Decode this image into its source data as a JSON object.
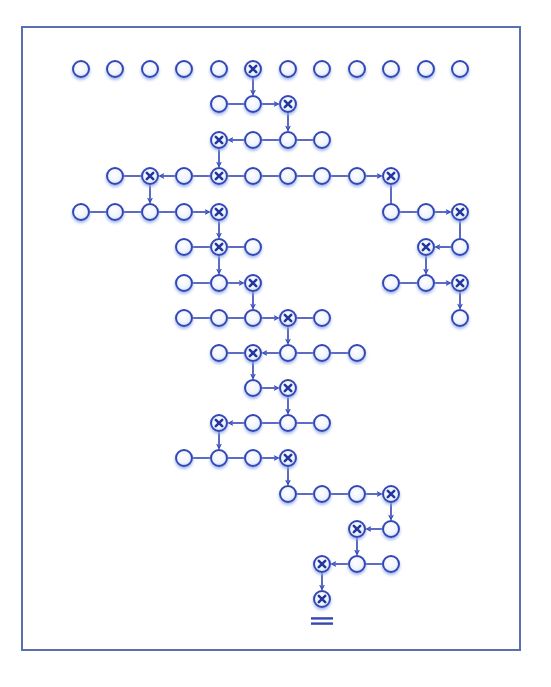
{
  "diagram": {
    "colors": {
      "frame": "#5a6fae",
      "stroke": "#3347b5",
      "fill_center": "#ffffff",
      "fill_edge": "#c8d6f5",
      "glow": "#9fb6ef",
      "x_mark": "#23389c"
    },
    "grid": {
      "col_x": [
        81,
        115,
        150,
        184,
        219,
        253,
        288,
        322,
        357,
        391,
        426,
        460
      ],
      "row_y": [
        69,
        104,
        140,
        176,
        212,
        247,
        283,
        318,
        353,
        388,
        423,
        458,
        494,
        529,
        564,
        599
      ],
      "radius": 8
    },
    "nodes": [
      {
        "r": 0,
        "c": 0
      },
      {
        "r": 0,
        "c": 1
      },
      {
        "r": 0,
        "c": 2
      },
      {
        "r": 0,
        "c": 3
      },
      {
        "r": 0,
        "c": 4
      },
      {
        "r": 0,
        "c": 5,
        "x": true
      },
      {
        "r": 0,
        "c": 6
      },
      {
        "r": 0,
        "c": 7
      },
      {
        "r": 0,
        "c": 8
      },
      {
        "r": 0,
        "c": 9
      },
      {
        "r": 0,
        "c": 10
      },
      {
        "r": 0,
        "c": 11
      },
      {
        "r": 1,
        "c": 4
      },
      {
        "r": 1,
        "c": 5
      },
      {
        "r": 1,
        "c": 6,
        "x": true
      },
      {
        "r": 2,
        "c": 4,
        "x": true
      },
      {
        "r": 2,
        "c": 5
      },
      {
        "r": 2,
        "c": 6
      },
      {
        "r": 2,
        "c": 7
      },
      {
        "r": 3,
        "c": 1
      },
      {
        "r": 3,
        "c": 2,
        "x": true
      },
      {
        "r": 3,
        "c": 3
      },
      {
        "r": 3,
        "c": 4,
        "x": true
      },
      {
        "r": 3,
        "c": 5
      },
      {
        "r": 3,
        "c": 6
      },
      {
        "r": 3,
        "c": 7
      },
      {
        "r": 3,
        "c": 8
      },
      {
        "r": 3,
        "c": 9,
        "x": true
      },
      {
        "r": 4,
        "c": 0
      },
      {
        "r": 4,
        "c": 1
      },
      {
        "r": 4,
        "c": 2
      },
      {
        "r": 4,
        "c": 3
      },
      {
        "r": 4,
        "c": 4,
        "x": true
      },
      {
        "r": 4,
        "c": 9
      },
      {
        "r": 4,
        "c": 10
      },
      {
        "r": 4,
        "c": 11,
        "x": true
      },
      {
        "r": 5,
        "c": 3
      },
      {
        "r": 5,
        "c": 4,
        "x": true
      },
      {
        "r": 5,
        "c": 5
      },
      {
        "r": 5,
        "c": 10,
        "x": true
      },
      {
        "r": 5,
        "c": 11
      },
      {
        "r": 6,
        "c": 3
      },
      {
        "r": 6,
        "c": 4
      },
      {
        "r": 6,
        "c": 5,
        "x": true
      },
      {
        "r": 6,
        "c": 9
      },
      {
        "r": 6,
        "c": 10
      },
      {
        "r": 6,
        "c": 11,
        "x": true
      },
      {
        "r": 7,
        "c": 3
      },
      {
        "r": 7,
        "c": 4
      },
      {
        "r": 7,
        "c": 5
      },
      {
        "r": 7,
        "c": 6,
        "x": true
      },
      {
        "r": 7,
        "c": 7
      },
      {
        "r": 7,
        "c": 11
      },
      {
        "r": 8,
        "c": 4
      },
      {
        "r": 8,
        "c": 5,
        "x": true
      },
      {
        "r": 8,
        "c": 6
      },
      {
        "r": 8,
        "c": 7
      },
      {
        "r": 8,
        "c": 8
      },
      {
        "r": 9,
        "c": 5
      },
      {
        "r": 9,
        "c": 6,
        "x": true
      },
      {
        "r": 10,
        "c": 4,
        "x": true
      },
      {
        "r": 10,
        "c": 5
      },
      {
        "r": 10,
        "c": 6
      },
      {
        "r": 10,
        "c": 7
      },
      {
        "r": 11,
        "c": 3
      },
      {
        "r": 11,
        "c": 4
      },
      {
        "r": 11,
        "c": 5
      },
      {
        "r": 11,
        "c": 6,
        "x": true
      },
      {
        "r": 12,
        "c": 6
      },
      {
        "r": 12,
        "c": 7
      },
      {
        "r": 12,
        "c": 8
      },
      {
        "r": 12,
        "c": 9,
        "x": true
      },
      {
        "r": 13,
        "c": 8,
        "x": true
      },
      {
        "r": 13,
        "c": 9
      },
      {
        "r": 14,
        "c": 7,
        "x": true
      },
      {
        "r": 14,
        "c": 8
      },
      {
        "r": 14,
        "c": 9
      },
      {
        "r": 15,
        "c": 7,
        "x": true
      }
    ],
    "edges": [
      {
        "from": [
          0,
          5
        ],
        "to": [
          1,
          5
        ],
        "arrow": true
      },
      {
        "from": [
          1,
          4
        ],
        "to": [
          1,
          5
        ],
        "arrow": false
      },
      {
        "from": [
          1,
          5
        ],
        "to": [
          1,
          6
        ],
        "arrow": true
      },
      {
        "from": [
          1,
          6
        ],
        "to": [
          2,
          6
        ],
        "arrow": true
      },
      {
        "from": [
          2,
          5
        ],
        "to": [
          2,
          4
        ],
        "arrow": true
      },
      {
        "from": [
          2,
          5
        ],
        "to": [
          2,
          6
        ],
        "arrow": false
      },
      {
        "from": [
          2,
          6
        ],
        "to": [
          2,
          7
        ],
        "arrow": false
      },
      {
        "from": [
          2,
          4
        ],
        "to": [
          3,
          4
        ],
        "arrow": true
      },
      {
        "from": [
          3,
          1
        ],
        "to": [
          3,
          2
        ],
        "arrow": false
      },
      {
        "from": [
          3,
          3
        ],
        "to": [
          3,
          2
        ],
        "arrow": true
      },
      {
        "from": [
          3,
          3
        ],
        "to": [
          3,
          4
        ],
        "arrow": false
      },
      {
        "from": [
          3,
          4
        ],
        "to": [
          3,
          5
        ],
        "arrow": false
      },
      {
        "from": [
          3,
          5
        ],
        "to": [
          3,
          6
        ],
        "arrow": false
      },
      {
        "from": [
          3,
          6
        ],
        "to": [
          3,
          7
        ],
        "arrow": false
      },
      {
        "from": [
          3,
          7
        ],
        "to": [
          3,
          8
        ],
        "arrow": false
      },
      {
        "from": [
          3,
          8
        ],
        "to": [
          3,
          9
        ],
        "arrow": true
      },
      {
        "from": [
          3,
          2
        ],
        "to": [
          4,
          2
        ],
        "arrow": true
      },
      {
        "from": [
          3,
          9
        ],
        "to": [
          4,
          9
        ],
        "arrow": false
      },
      {
        "from": [
          4,
          0
        ],
        "to": [
          4,
          1
        ],
        "arrow": false
      },
      {
        "from": [
          4,
          1
        ],
        "to": [
          4,
          2
        ],
        "arrow": false
      },
      {
        "from": [
          4,
          2
        ],
        "to": [
          4,
          3
        ],
        "arrow": false
      },
      {
        "from": [
          4,
          3
        ],
        "to": [
          4,
          4
        ],
        "arrow": true
      },
      {
        "from": [
          4,
          9
        ],
        "to": [
          4,
          10
        ],
        "arrow": false
      },
      {
        "from": [
          4,
          10
        ],
        "to": [
          4,
          11
        ],
        "arrow": true
      },
      {
        "from": [
          4,
          4
        ],
        "to": [
          5,
          4
        ],
        "arrow": true
      },
      {
        "from": [
          4,
          11
        ],
        "to": [
          5,
          11
        ],
        "arrow": false
      },
      {
        "from": [
          5,
          3
        ],
        "to": [
          5,
          4
        ],
        "arrow": false
      },
      {
        "from": [
          5,
          4
        ],
        "to": [
          5,
          5
        ],
        "arrow": false
      },
      {
        "from": [
          5,
          11
        ],
        "to": [
          5,
          10
        ],
        "arrow": true
      },
      {
        "from": [
          5,
          4
        ],
        "to": [
          6,
          4
        ],
        "arrow": true
      },
      {
        "from": [
          5,
          10
        ],
        "to": [
          6,
          10
        ],
        "arrow": true
      },
      {
        "from": [
          6,
          3
        ],
        "to": [
          6,
          4
        ],
        "arrow": false
      },
      {
        "from": [
          6,
          4
        ],
        "to": [
          6,
          5
        ],
        "arrow": true
      },
      {
        "from": [
          6,
          9
        ],
        "to": [
          6,
          10
        ],
        "arrow": false
      },
      {
        "from": [
          6,
          10
        ],
        "to": [
          6,
          11
        ],
        "arrow": true
      },
      {
        "from": [
          6,
          5
        ],
        "to": [
          7,
          5
        ],
        "arrow": true
      },
      {
        "from": [
          6,
          11
        ],
        "to": [
          7,
          11
        ],
        "arrow": true
      },
      {
        "from": [
          7,
          3
        ],
        "to": [
          7,
          4
        ],
        "arrow": false
      },
      {
        "from": [
          7,
          4
        ],
        "to": [
          7,
          5
        ],
        "arrow": false
      },
      {
        "from": [
          7,
          5
        ],
        "to": [
          7,
          6
        ],
        "arrow": true
      },
      {
        "from": [
          7,
          6
        ],
        "to": [
          7,
          7
        ],
        "arrow": false
      },
      {
        "from": [
          7,
          6
        ],
        "to": [
          8,
          6
        ],
        "arrow": true
      },
      {
        "from": [
          8,
          4
        ],
        "to": [
          8,
          5
        ],
        "arrow": false
      },
      {
        "from": [
          8,
          6
        ],
        "to": [
          8,
          5
        ],
        "arrow": true
      },
      {
        "from": [
          8,
          6
        ],
        "to": [
          8,
          7
        ],
        "arrow": false
      },
      {
        "from": [
          8,
          7
        ],
        "to": [
          8,
          8
        ],
        "arrow": false
      },
      {
        "from": [
          8,
          5
        ],
        "to": [
          9,
          5
        ],
        "arrow": true
      },
      {
        "from": [
          9,
          5
        ],
        "to": [
          9,
          6
        ],
        "arrow": true
      },
      {
        "from": [
          9,
          6
        ],
        "to": [
          10,
          6
        ],
        "arrow": true
      },
      {
        "from": [
          10,
          5
        ],
        "to": [
          10,
          4
        ],
        "arrow": true
      },
      {
        "from": [
          10,
          5
        ],
        "to": [
          10,
          6
        ],
        "arrow": false
      },
      {
        "from": [
          10,
          6
        ],
        "to": [
          10,
          7
        ],
        "arrow": false
      },
      {
        "from": [
          10,
          4
        ],
        "to": [
          11,
          4
        ],
        "arrow": true
      },
      {
        "from": [
          11,
          3
        ],
        "to": [
          11,
          4
        ],
        "arrow": false
      },
      {
        "from": [
          11,
          4
        ],
        "to": [
          11,
          5
        ],
        "arrow": false
      },
      {
        "from": [
          11,
          5
        ],
        "to": [
          11,
          6
        ],
        "arrow": true
      },
      {
        "from": [
          11,
          6
        ],
        "to": [
          12,
          6
        ],
        "arrow": true
      },
      {
        "from": [
          12,
          6
        ],
        "to": [
          12,
          7
        ],
        "arrow": false
      },
      {
        "from": [
          12,
          7
        ],
        "to": [
          12,
          8
        ],
        "arrow": false
      },
      {
        "from": [
          12,
          8
        ],
        "to": [
          12,
          9
        ],
        "arrow": true
      },
      {
        "from": [
          12,
          9
        ],
        "to": [
          13,
          9
        ],
        "arrow": true
      },
      {
        "from": [
          13,
          9
        ],
        "to": [
          13,
          8
        ],
        "arrow": true
      },
      {
        "from": [
          13,
          8
        ],
        "to": [
          14,
          8
        ],
        "arrow": true
      },
      {
        "from": [
          14,
          8
        ],
        "to": [
          14,
          7
        ],
        "arrow": true
      },
      {
        "from": [
          14,
          8
        ],
        "to": [
          14,
          9
        ],
        "arrow": false
      },
      {
        "from": [
          14,
          7
        ],
        "to": [
          15,
          7
        ],
        "arrow": true
      }
    ],
    "result_symbol": {
      "label": "=",
      "x": 322,
      "y": 621,
      "width": 22
    }
  }
}
